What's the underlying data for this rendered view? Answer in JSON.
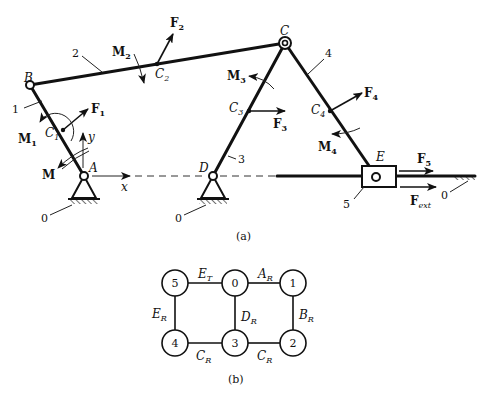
{
  "figure_a": {
    "caption": "(a)",
    "joints": {
      "A": "A",
      "B": "B",
      "C": "C",
      "D": "D",
      "E": "E"
    },
    "mass_centers": {
      "C1": "C",
      "C1_sub": "1",
      "C2": "C",
      "C2_sub": "2",
      "C3": "C",
      "C3_sub": "3",
      "C4": "C",
      "C4_sub": "4"
    },
    "link_numbers": {
      "ground_a": "0",
      "ground_d": "0",
      "ground_e": "0",
      "link1": "1",
      "link2": "2",
      "link3": "3",
      "link4": "4",
      "link5": "5"
    },
    "forces": {
      "F1": "F",
      "F1_sub": "1",
      "F2": "F",
      "F2_sub": "2",
      "F3": "F",
      "F3_sub": "3",
      "F4": "F",
      "F4_sub": "4",
      "F5": "F",
      "F5_sub": "5",
      "Fext": "F",
      "Fext_sub": "ext"
    },
    "moments": {
      "M": "M",
      "M1": "M",
      "M1_sub": "1",
      "M2": "M",
      "M2_sub": "2",
      "M3": "M",
      "M3_sub": "3",
      "M4": "M",
      "M4_sub": "4"
    },
    "axes": {
      "x": "x",
      "y": "y"
    }
  },
  "figure_b": {
    "caption": "(b)",
    "nodes": [
      "5",
      "0",
      "1",
      "4",
      "3",
      "2"
    ],
    "edges": {
      "ET": "E",
      "ET_sub": "T",
      "AR": "A",
      "AR_sub": "R",
      "ER": "E",
      "ER_sub": "R",
      "DR": "D",
      "DR_sub": "R",
      "BR": "B",
      "BR_sub": "R",
      "CR_left": "C",
      "CR_left_sub": "R",
      "CR_right": "C",
      "CR_right_sub": "R"
    }
  }
}
